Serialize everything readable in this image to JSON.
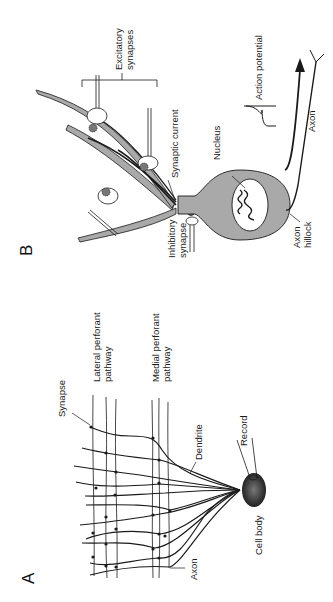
{
  "figure": {
    "orientation": "rotated 90 degrees counter-clockwise",
    "panels": [
      {
        "id": "A",
        "letter": "A",
        "labels": {
          "lateral_line1": "Lateral  perforant",
          "lateral_line2": "pathway",
          "medial_line1": "Medial  perforant",
          "medial_line2": "pathway",
          "synapse": "Synapse",
          "dendrite": "Dendrite",
          "record": "Record",
          "cell_body": "Cell  body",
          "axon": "Axon"
        }
      },
      {
        "id": "B",
        "letter": "B",
        "labels": {
          "excitatory_line1": "Excitatory",
          "excitatory_line2": "synapses",
          "synaptic_current": "Synaptic  current",
          "nucleus": "Nucleus",
          "action_potential": "Action  potential",
          "axon": "Axon",
          "inhibitory_line1": "Inhibitory",
          "inhibitory_line2": "synapse",
          "axon_hillock_line1": "Axon",
          "axon_hillock_line2": "hillock"
        }
      }
    ],
    "colors": {
      "ink": "#1a1a1a",
      "cell_fill": "#a9a9a9",
      "background": "#ffffff"
    }
  }
}
